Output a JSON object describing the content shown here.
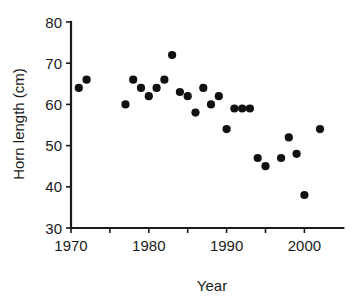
{
  "chart_data": {
    "type": "scatter",
    "title": "",
    "xlabel": "Year",
    "ylabel": "Horn length (cm)",
    "xlim": [
      1970,
      2004
    ],
    "ylim": [
      30,
      80
    ],
    "xticks": [
      1970,
      1975,
      1980,
      1985,
      1990,
      1995,
      2000
    ],
    "xtick_labels_shown": [
      "1970",
      "1980",
      "1990",
      "2000"
    ],
    "xtick_labels_shown_values": [
      1970,
      1980,
      1990,
      2000
    ],
    "yticks": [
      30,
      40,
      50,
      60,
      70,
      80
    ],
    "ytick_labels": [
      "30",
      "40",
      "50",
      "60",
      "70",
      "80"
    ],
    "grid": false,
    "legend": false,
    "marker": "filled-circle",
    "marker_color": "#111111",
    "series": [
      {
        "name": "Horn length",
        "points": [
          {
            "x": 1971,
            "y": 64
          },
          {
            "x": 1972,
            "y": 66
          },
          {
            "x": 1977,
            "y": 60
          },
          {
            "x": 1978,
            "y": 66
          },
          {
            "x": 1979,
            "y": 64
          },
          {
            "x": 1980,
            "y": 62
          },
          {
            "x": 1981,
            "y": 64
          },
          {
            "x": 1982,
            "y": 66
          },
          {
            "x": 1983,
            "y": 72
          },
          {
            "x": 1984,
            "y": 63
          },
          {
            "x": 1985,
            "y": 62
          },
          {
            "x": 1986,
            "y": 58
          },
          {
            "x": 1987,
            "y": 64
          },
          {
            "x": 1988,
            "y": 60
          },
          {
            "x": 1989,
            "y": 62
          },
          {
            "x": 1990,
            "y": 54
          },
          {
            "x": 1991,
            "y": 59
          },
          {
            "x": 1992,
            "y": 59
          },
          {
            "x": 1993,
            "y": 59
          },
          {
            "x": 1994,
            "y": 47
          },
          {
            "x": 1995,
            "y": 45
          },
          {
            "x": 1997,
            "y": 47
          },
          {
            "x": 1998,
            "y": 52
          },
          {
            "x": 1999,
            "y": 48
          },
          {
            "x": 2000,
            "y": 38
          },
          {
            "x": 2002,
            "y": 54
          }
        ]
      }
    ]
  }
}
